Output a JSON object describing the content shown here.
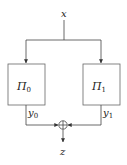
{
  "diagram": {
    "input_label": "x",
    "output_label": "z",
    "blocks": [
      {
        "label": "Π",
        "subscript": "0",
        "output_label": "y",
        "output_subscript": "0"
      },
      {
        "label": "Π",
        "subscript": "1",
        "output_label": "y",
        "output_subscript": "1"
      }
    ],
    "combiner": "xor",
    "colors": {
      "stroke": "#333333",
      "box": "#666666"
    }
  }
}
